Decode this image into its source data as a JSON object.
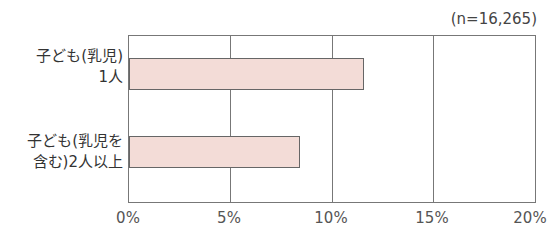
{
  "chart_data": {
    "type": "bar",
    "orientation": "horizontal",
    "title": "",
    "annotation": "(n=16,265)",
    "categories": [
      "子ども(乳児)\n1人",
      "子ども(乳児を\n含む)2人以上"
    ],
    "values": [
      11.6,
      8.4
    ],
    "unit": "%",
    "xlabel": "",
    "ylabel": "",
    "xlim": [
      0,
      20
    ],
    "ticks": [
      "0%",
      "5%",
      "10%",
      "15%",
      "20%"
    ],
    "grid": true,
    "bar_color": "#f3dcd7",
    "legend": null
  },
  "labels": {
    "n": "(n=16,265)",
    "cat0": "子ども(乳児)\n1人",
    "cat1": "子ども(乳児を\n含む)2人以上",
    "t0": "0%",
    "t1": "5%",
    "t2": "10%",
    "t3": "15%",
    "t4": "20%"
  }
}
